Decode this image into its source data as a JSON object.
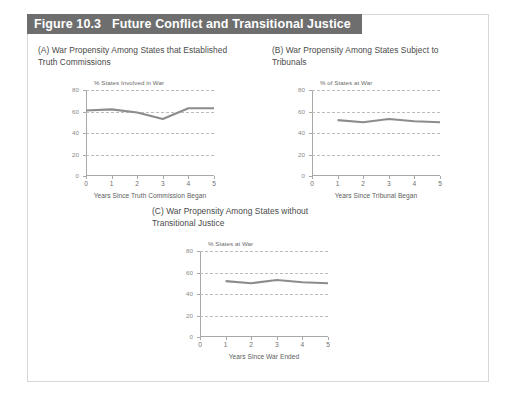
{
  "figure": {
    "number_label": "Figure 10.3",
    "title": "Future Conflict and Transitional Justice",
    "title_bar_color": "#6e6e6e",
    "border_color": "#d7d7d7",
    "background_color": "#ffffff",
    "line_color": "#8c8c8c",
    "grid_color": "#bdbdbd",
    "axis_color": "#a8a8a8"
  },
  "panels": [
    {
      "key": "a",
      "caption": "(A) War Propensity Among States that Established\n       Truth Commissions"
    },
    {
      "key": "b",
      "caption": "(B) War Propensity Among States Subject to\n       Tribunals"
    },
    {
      "key": "c",
      "caption": "(C) War Propensity Among States without\n       Transitional Justice"
    }
  ],
  "chart_data": [
    {
      "id": "chart-a",
      "type": "line",
      "title": "",
      "ylabel": "% States Involved in War",
      "xlabel": "Years Since Truth Commission Began",
      "x": [
        0,
        1,
        2,
        3,
        4,
        5
      ],
      "categories": [
        "0",
        "1",
        "2",
        "3",
        "4",
        "5"
      ],
      "values": [
        61,
        62,
        59,
        53,
        63,
        63
      ],
      "xticks": [
        "0",
        "1",
        "2",
        "3",
        "4",
        "5"
      ],
      "yticks": [
        "0",
        "20",
        "40",
        "60",
        "80"
      ],
      "ylim": [
        0,
        80
      ],
      "xlim": [
        0,
        5
      ],
      "grid": true,
      "legend": "none"
    },
    {
      "id": "chart-b",
      "type": "line",
      "title": "",
      "ylabel": "% of States at War",
      "xlabel": "Years Since Tribunal Began",
      "x": [
        1,
        2,
        3,
        4,
        5
      ],
      "categories": [
        "1",
        "2",
        "3",
        "4",
        "5"
      ],
      "values": [
        52,
        50,
        53,
        51,
        50
      ],
      "xticks": [
        "0",
        "1",
        "2",
        "3",
        "4",
        "5"
      ],
      "yticks": [
        "0",
        "20",
        "40",
        "60",
        "80"
      ],
      "ylim": [
        0,
        80
      ],
      "xlim": [
        0,
        5
      ],
      "grid": true,
      "legend": "none"
    },
    {
      "id": "chart-c",
      "type": "line",
      "title": "",
      "ylabel": "% States at War",
      "xlabel": "Years Since War Ended",
      "x": [
        1,
        2,
        3,
        4,
        5
      ],
      "categories": [
        "1",
        "2",
        "3",
        "4",
        "5"
      ],
      "values": [
        52,
        50,
        53,
        51,
        50
      ],
      "xticks": [
        "0",
        "1",
        "2",
        "3",
        "4",
        "5"
      ],
      "yticks": [
        "0",
        "20",
        "40",
        "60",
        "80"
      ],
      "ylim": [
        0,
        80
      ],
      "xlim": [
        0,
        5
      ],
      "grid": true,
      "legend": "none"
    }
  ]
}
